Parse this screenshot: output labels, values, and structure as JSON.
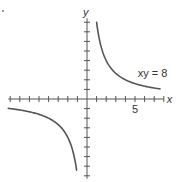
{
  "chart_data": {
    "type": "line",
    "title": "",
    "equation": "xy = 8",
    "annotation": {
      "text": "xy = 8",
      "x": 5.5,
      "y": 2.7
    },
    "xlabel": "x",
    "ylabel": "y",
    "x_tick_labels": [
      {
        "value": 5,
        "label": "5"
      }
    ],
    "xlim": [
      -8.2,
      8
    ],
    "ylim": [
      -8.3,
      8.4
    ],
    "tick_step": 1,
    "grid": false,
    "legend": "none",
    "series": [
      {
        "name": "xy = 8 (quadrant I branch)",
        "x": [
          1.0,
          1.25,
          1.5,
          2.0,
          2.5,
          3.0,
          4.0,
          5.0,
          6.0,
          7.0,
          7.6
        ],
        "y": [
          8.0,
          6.4,
          5.33,
          4.0,
          3.2,
          2.67,
          2.0,
          1.6,
          1.33,
          1.14,
          1.05
        ]
      },
      {
        "name": "xy = 8 (quadrant III branch)",
        "x": [
          -8.2,
          -7.0,
          -6.0,
          -5.0,
          -4.0,
          -3.0,
          -2.5,
          -2.0,
          -1.5,
          -1.25,
          -1.08
        ],
        "y": [
          -0.98,
          -1.14,
          -1.33,
          -1.6,
          -2.0,
          -2.67,
          -3.2,
          -4.0,
          -5.33,
          -6.4,
          -7.4
        ]
      }
    ]
  },
  "labels": {
    "x_axis": "x",
    "y_axis": "y",
    "tick_five": "5",
    "curve_label": "xy = 8"
  },
  "colors": {
    "axis": "#555555",
    "curve": "#555555",
    "text": "#333333",
    "background": "#ffffff"
  }
}
